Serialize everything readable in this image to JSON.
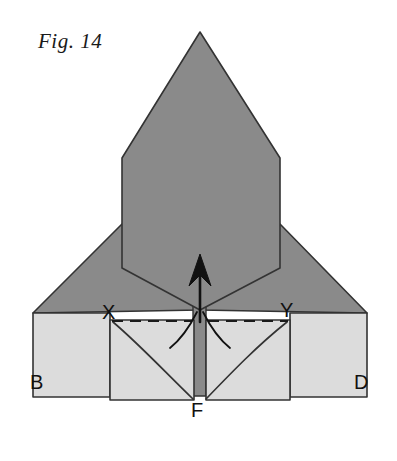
{
  "figure": {
    "caption": "Fig. 14",
    "type": "origami-folding-diagram",
    "background_color": "#ffffff",
    "colors": {
      "dark_gray_paper": "#8a8a8a",
      "light_gray_paper": "#dcdcdc",
      "outline": "#333333",
      "ink": "#111111"
    },
    "labels": [
      {
        "id": "B",
        "text": "B",
        "x": 38,
        "y": 383
      },
      {
        "id": "X",
        "text": "X",
        "x": 110,
        "y": 313
      },
      {
        "id": "Y",
        "text": "Y",
        "x": 288,
        "y": 311
      },
      {
        "id": "D",
        "text": "D",
        "x": 362,
        "y": 383
      },
      {
        "id": "F",
        "text": "F",
        "x": 198,
        "y": 411
      }
    ],
    "shapes": {
      "spear_body": "M200,32 L280,158 L280,268 L200,310 L122,268 L122,158 Z",
      "left_wing": "M33,313 L122,224 L200,310 L33,313 Z",
      "right_wing": "M367,313 L280,224 L200,310 L367,313 Z",
      "left_outer_panel": "M33,313 L110,313 L110,397 L33,397 Z",
      "right_outer_panel": "M290,313 L367,313 L367,397 L290,397 Z",
      "left_flap": "M110,320 L194,320 L194,400 L110,400 Z",
      "right_flap": "M206,320 L290,320 L290,400 L206,400 Z",
      "center_strip": "M193,300 L206,300 L206,396 L193,396 Z"
    },
    "fold_lines": {
      "left_dashed": {
        "x1": 112,
        "y1": 321,
        "x2": 192,
        "y2": 321
      },
      "right_dashed": {
        "x1": 208,
        "y1": 321,
        "x2": 288,
        "y2": 321
      },
      "left_curve": "M113,322 C140,345 165,372 193,399",
      "right_curve": "M206,399 C232,372 258,345 287,322"
    },
    "arrow": {
      "name": "fold-up-arrow",
      "direction": "up",
      "tip_x": 200,
      "tip_y": 254,
      "tail_y": 322,
      "swirl_left": "M197,312 C188,330 180,340 170,348",
      "swirl_right": "M203,312 C212,330 220,340 230,348"
    }
  }
}
